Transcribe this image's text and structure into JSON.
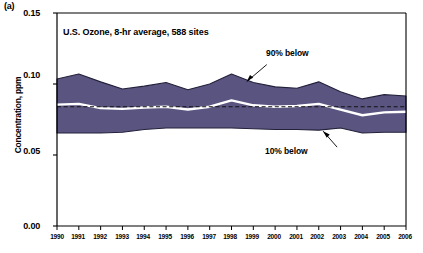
{
  "panel_label": "(a)",
  "axis": {
    "y_title": "Concentration, ppm",
    "y_ticks": [
      "0.15",
      "0.10",
      "0.05",
      "0.00"
    ],
    "x_ticks": [
      "1990",
      "1991",
      "1992",
      "1993",
      "1994",
      "1995",
      "1996",
      "1997",
      "1998",
      "1999",
      "2000",
      "2001",
      "2002",
      "2003",
      "2004",
      "2005",
      "2006"
    ]
  },
  "annotations": {
    "title": "U.S. Ozone, 8-hr average, 588 sites",
    "upper_band": "90% below",
    "lower_band": "10% below",
    "standard": "National Standard"
  },
  "colors": {
    "band_fill": "#5a5580",
    "band_edge": "#23203a",
    "median_line": "#ffffff",
    "standard_line": "#111111",
    "axis": "#000000"
  },
  "chart_data": {
    "type": "area",
    "title": "U.S. Ozone, 8-hr average, 588 sites",
    "xlabel": "",
    "ylabel": "Concentration, ppm",
    "xlim": [
      1990,
      2006
    ],
    "ylim": [
      0.0,
      0.15
    ],
    "grid": false,
    "legend_position": "inline-annotations",
    "x": [
      1990,
      1991,
      1992,
      1993,
      1994,
      1995,
      1996,
      1997,
      1998,
      1999,
      2000,
      2001,
      2002,
      2003,
      2004,
      2005,
      2006
    ],
    "series": [
      {
        "name": "90% below",
        "values": [
          0.1035,
          0.107,
          0.1015,
          0.0965,
          0.0985,
          0.101,
          0.096,
          0.1,
          0.107,
          0.101,
          0.098,
          0.097,
          0.1015,
          0.0945,
          0.0895,
          0.0925,
          0.0915
        ]
      },
      {
        "name": "Median",
        "values": [
          0.0855,
          0.086,
          0.083,
          0.0825,
          0.0835,
          0.084,
          0.082,
          0.084,
          0.0885,
          0.085,
          0.084,
          0.0845,
          0.086,
          0.082,
          0.078,
          0.08,
          0.0805
        ]
      },
      {
        "name": "10% below",
        "values": [
          0.0655,
          0.0655,
          0.0655,
          0.066,
          0.068,
          0.069,
          0.069,
          0.069,
          0.069,
          0.0685,
          0.068,
          0.068,
          0.0675,
          0.069,
          0.0655,
          0.066,
          0.066
        ]
      }
    ],
    "reference_lines": [
      {
        "name": "National Standard",
        "value": 0.084,
        "style": "dashed"
      }
    ]
  }
}
